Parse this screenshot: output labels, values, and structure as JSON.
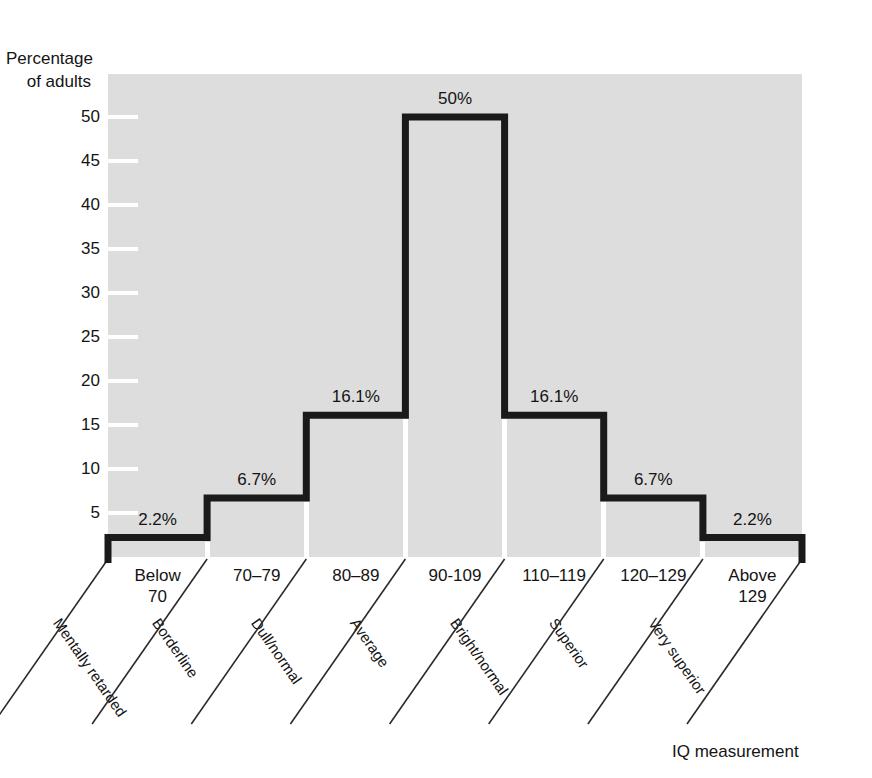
{
  "chart_data": {
    "type": "bar",
    "title": "",
    "xlabel": "IQ measurement",
    "ylabel": "Percentage\nof adults",
    "ylabel_line1": "Percentage",
    "ylabel_line2": "of adults",
    "ylim": [
      0,
      52
    ],
    "yticks": [
      5,
      10,
      15,
      20,
      25,
      30,
      35,
      40,
      45,
      50
    ],
    "ytick_labels": [
      "5",
      "10",
      "15",
      "20",
      "25",
      "30",
      "35",
      "40",
      "45",
      "50"
    ],
    "grid": false,
    "legend": "none",
    "categories": [
      "Below\n70",
      "70–79",
      "80–89",
      "90-109",
      "110–119",
      "120–129",
      "Above\n129"
    ],
    "bins": [
      {
        "range": "Below\n70",
        "label": "Mentally\nretarded",
        "category_label": "Mentally retarded",
        "value": 2.2,
        "value_label": "2.2%"
      },
      {
        "range": "70–79",
        "label": "Borderline",
        "category_label": "Borderline",
        "value": 6.7,
        "value_label": "6.7%"
      },
      {
        "range": "80–89",
        "label": "Dull/normal",
        "category_label": "Dull/normal",
        "value": 16.1,
        "value_label": "16.1%"
      },
      {
        "range": "90-109",
        "label": "Average",
        "category_label": "Average",
        "value": 50,
        "value_label": "50%"
      },
      {
        "range": "110–119",
        "label": "Bright/normal",
        "category_label": "Bright/normal",
        "value": 16.1,
        "value_label": "16.1%"
      },
      {
        "range": "120–129",
        "label": "Superior",
        "category_label": "Superior",
        "value": 6.7,
        "value_label": "6.7%"
      },
      {
        "range": "Above\n129",
        "label": "Very superior",
        "category_label": "Very superior",
        "value": 2.2,
        "value_label": "2.2%"
      }
    ],
    "values": [
      2.2,
      6.7,
      16.1,
      50,
      16.1,
      6.7,
      2.2
    ],
    "value_labels": [
      "2.2%",
      "6.7%",
      "16.1%",
      "50%",
      "16.1%",
      "6.7%",
      "2.2%"
    ],
    "colors": {
      "plot_background": "#dddddd",
      "page_background": "#ffffff",
      "outline": "#1a1a1a",
      "tick": "#ffffff",
      "text": "#141414"
    }
  }
}
